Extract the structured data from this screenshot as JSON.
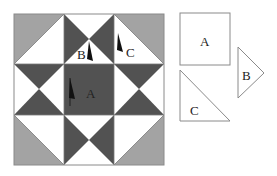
{
  "diagram": {
    "colors": {
      "gray": "#a3a3a3",
      "dark": "#525252",
      "white": "#ffffff",
      "outline": "#8a8a8a",
      "marker": "#111111"
    },
    "block_labels": {
      "a": "A",
      "b": "B",
      "c": "C"
    },
    "templates": [
      {
        "shape": "square",
        "label": "A"
      },
      {
        "shape": "right-triangle",
        "label": "C"
      },
      {
        "shape": "isosceles-triangle",
        "label": "B"
      }
    ]
  }
}
